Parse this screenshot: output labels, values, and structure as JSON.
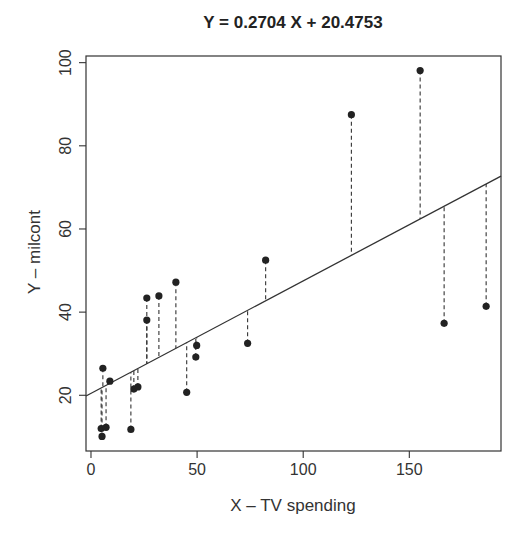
{
  "chart_data": {
    "type": "scatter",
    "title": "Y = 0.2704 X + 20.4753",
    "xlabel": "X – TV spending",
    "ylabel": "Y – milcont",
    "xlim": [
      -2.35,
      193.2
    ],
    "ylim": [
      6.6,
      101.6
    ],
    "xticks": [
      0,
      50,
      100,
      150
    ],
    "yticks": [
      20,
      40,
      60,
      80,
      100
    ],
    "grid": false,
    "legend": null,
    "regression_line": {
      "slope": 0.2704,
      "intercept": 20.4753,
      "style": "solid"
    },
    "residual_segments": {
      "style": "dashed",
      "description": "vertical dashed lines from each point to the fitted line"
    },
    "points": [
      {
        "x": 4.8,
        "y": 12.0
      },
      {
        "x": 5.2,
        "y": 10.1
      },
      {
        "x": 5.6,
        "y": 26.5
      },
      {
        "x": 7.1,
        "y": 12.3
      },
      {
        "x": 8.9,
        "y": 23.4
      },
      {
        "x": 18.8,
        "y": 11.8
      },
      {
        "x": 20.2,
        "y": 21.5
      },
      {
        "x": 22.1,
        "y": 22.0
      },
      {
        "x": 26.3,
        "y": 43.4
      },
      {
        "x": 26.3,
        "y": 38.1
      },
      {
        "x": 32.0,
        "y": 43.9
      },
      {
        "x": 40.0,
        "y": 47.2
      },
      {
        "x": 45.1,
        "y": 20.7
      },
      {
        "x": 49.4,
        "y": 29.2
      },
      {
        "x": 49.8,
        "y": 32.0
      },
      {
        "x": 73.8,
        "y": 32.5
      },
      {
        "x": 82.3,
        "y": 52.5
      },
      {
        "x": 122.7,
        "y": 87.5
      },
      {
        "x": 155.1,
        "y": 98.1
      },
      {
        "x": 166.4,
        "y": 37.3
      },
      {
        "x": 186.2,
        "y": 41.4
      }
    ]
  },
  "colors": {
    "point": "#222222",
    "line": "#333333",
    "axis": "#333333",
    "background": "#ffffff"
  }
}
